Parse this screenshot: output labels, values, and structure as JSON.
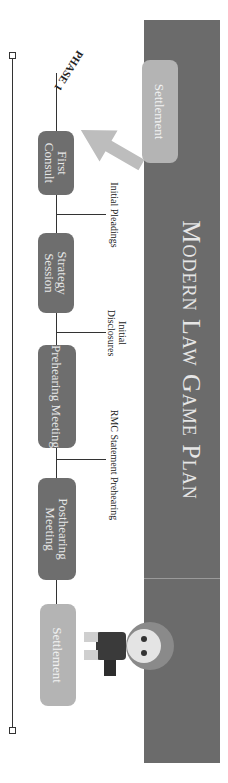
{
  "title": "Modern Law Game Plan",
  "phase_label": "PHASE 1",
  "top_box": "Settlement",
  "steps": [
    {
      "label": "First Consult",
      "style": "dark"
    },
    {
      "label": "Strategy Session",
      "style": "dark"
    },
    {
      "label": "Prehearing Meeting",
      "style": "dark"
    },
    {
      "label": "Posthearing Meeting",
      "style": "dark"
    },
    {
      "label": "Settlement",
      "style": "light"
    }
  ],
  "milestones": [
    {
      "label": "Initial Pleadings"
    },
    {
      "label": "Initial Disclosures"
    },
    {
      "label": "RMC Statement Prehearing"
    }
  ],
  "colors": {
    "banner": "#6b6b6b",
    "step_box": "#6e6e6e",
    "settlement_box": "#b4b4b4",
    "arrow": "#bdbdbd"
  }
}
